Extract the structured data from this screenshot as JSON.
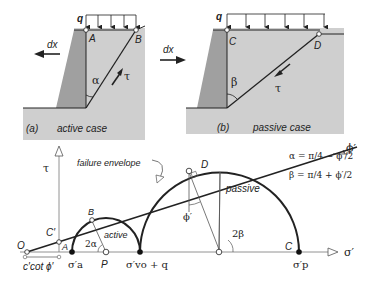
{
  "panel_a": {
    "tag": "(a)",
    "caption": "active case",
    "load_label": "q",
    "displacement_label": "dx",
    "point_top_left": "A",
    "point_top_right": "B",
    "angle_label": "α",
    "shear_label": "τ"
  },
  "panel_b": {
    "tag": "(b)",
    "caption": "passive case",
    "load_label": "q",
    "displacement_label": "dx",
    "point_top_left": "C",
    "point_top_right": "D",
    "angle_label": "β",
    "shear_label": "τ"
  },
  "mohr": {
    "y_axis_label": "τ",
    "x_axis_label": "σ′",
    "envelope_label": "failure envelope",
    "envelope_angle_label": "ϕ′",
    "origin_label": "O",
    "intercept_label": "C′",
    "intercept_distance_label": "c′cot ϕ′",
    "point_a": "A",
    "point_b": "B",
    "point_c": "C",
    "point_d": "D",
    "point_p": "P",
    "active_label": "active",
    "passive_label": "passive",
    "angle_2alpha": "2α",
    "angle_2beta": "2β",
    "angle_phi_at_d": "ϕ′",
    "sigma_a": "σ′a",
    "sigma_vo_q": "σ′vo + q",
    "sigma_p": "σ′p",
    "formula_alpha": "α = π/4 − ϕ′/2",
    "formula_beta": "β = π/4 + ϕ′/2"
  },
  "colors": {
    "soil": "#c8c8c8",
    "wall": "#9a9a9a",
    "line": "#222222"
  }
}
